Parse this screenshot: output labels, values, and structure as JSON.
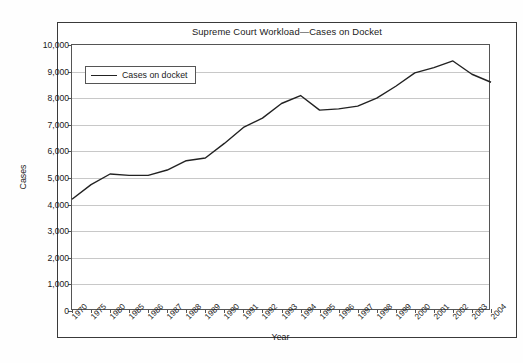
{
  "chart_data": {
    "type": "line",
    "title": "Supreme Court Workload—Cases on Docket",
    "xlabel": "Year",
    "ylabel": "Cases",
    "legend_position": "top-left",
    "grid": true,
    "ylim": [
      0,
      10000
    ],
    "yticks": [
      "0",
      "1,000",
      "2,000",
      "3,000",
      "4,000",
      "5,000",
      "6,000",
      "7,000",
      "8,000",
      "9,000",
      "10,000"
    ],
    "ytick_values": [
      0,
      1000,
      2000,
      3000,
      4000,
      5000,
      6000,
      7000,
      8000,
      9000,
      10000
    ],
    "categories": [
      "1970",
      "1975",
      "1980",
      "1985",
      "1986",
      "1987",
      "1988",
      "1989",
      "1990",
      "1991",
      "1992",
      "1993",
      "1994",
      "1995",
      "1996",
      "1997",
      "1998",
      "1999",
      "2000",
      "2001",
      "2002",
      "2003",
      "2004"
    ],
    "series": [
      {
        "name": "Cases on docket",
        "values": [
          4200,
          4750,
          5150,
          5100,
          5100,
          5300,
          5650,
          5750,
          6300,
          6900,
          7250,
          7800,
          8100,
          7550,
          7600,
          7700,
          8000,
          8450,
          8950,
          9150,
          9400,
          8900,
          8600
        ]
      }
    ]
  },
  "legend": {
    "label": "Cases on docket"
  }
}
